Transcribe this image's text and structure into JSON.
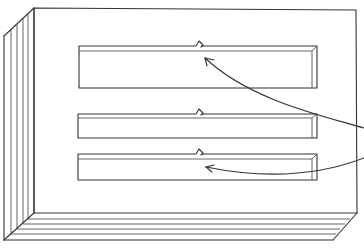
{
  "figure": {
    "colors": {
      "line": "#333333",
      "background": "#ffffff"
    },
    "board": {
      "front_face": {
        "left": 34,
        "top": 8,
        "right": 358,
        "bottom": 213
      },
      "side_layer_x": [
        4,
        11,
        17,
        23,
        28,
        34
      ],
      "bottom_layer_y": [
        213,
        219,
        224,
        229,
        234,
        240
      ],
      "layer_count": 6
    },
    "slots": [
      {
        "name": "slot-top",
        "x1": 79,
        "y1": 46,
        "x2": 317,
        "y2": 88,
        "inner_y": 51,
        "notch_x": 196
      },
      {
        "name": "slot-middle",
        "x1": 78,
        "y1": 114,
        "x2": 317,
        "y2": 138,
        "inner_y": 118,
        "notch_x": 196
      },
      {
        "name": "slot-bottom",
        "x1": 78,
        "y1": 154,
        "x2": 317,
        "y2": 180,
        "inner_y": 159,
        "notch_x": 196
      }
    ],
    "leaders": [
      {
        "name": "leader-arrow-top",
        "target": "slot-top notch"
      },
      {
        "name": "leader-arrow-bottom",
        "target": "slot-bottom notch"
      }
    ]
  }
}
